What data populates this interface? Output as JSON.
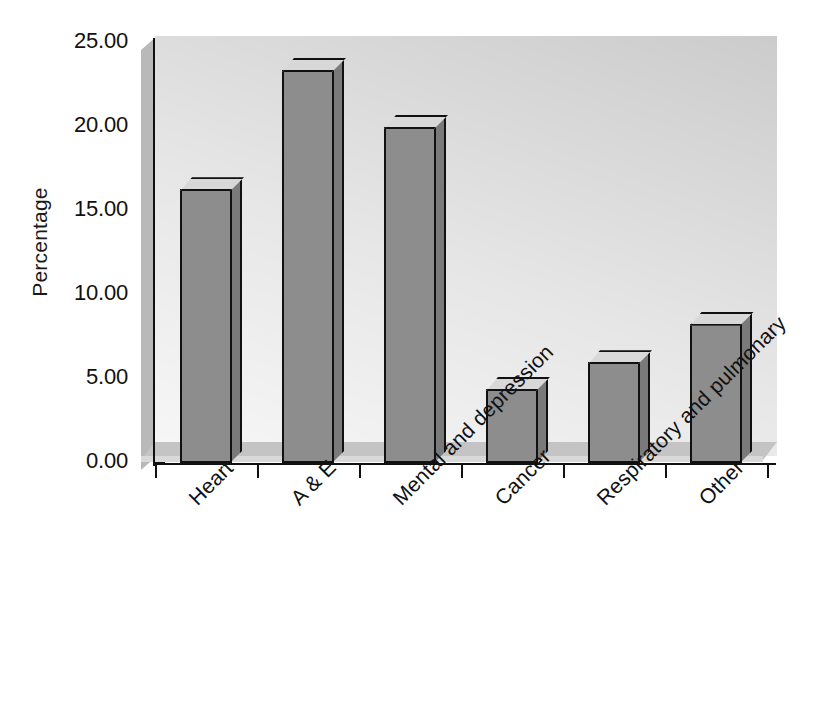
{
  "chart_data": {
    "type": "bar",
    "title": "",
    "subtitle": "",
    "xlabel": "",
    "ylabel": "Percentage",
    "categories": [
      "Heart",
      "A & E",
      "Mental and depression",
      "Cancer",
      "Respiratory and pulmonary",
      "Other"
    ],
    "values": [
      16.3,
      23.4,
      20.0,
      4.4,
      6.0,
      8.3
    ],
    "ylim": [
      0.0,
      25.0
    ],
    "ytick_values": [
      0.0,
      5.0,
      10.0,
      15.0,
      20.0,
      25.0
    ],
    "ytick_labels": [
      "0.00",
      "5.00",
      "10.00",
      "15.00",
      "20.00",
      "25.00"
    ],
    "grid": false,
    "legend": null,
    "legend_position": "none",
    "style": "3d-column",
    "series": [
      {
        "name": "Percentage",
        "values": [
          16.3,
          23.4,
          20.0,
          4.4,
          6.0,
          8.3
        ]
      }
    ],
    "annotations": []
  },
  "colors": {
    "bar_front": "#8d8d8d",
    "bar_side": "#7a7a7a",
    "bar_top": "#d8d8d8",
    "wall": "#c9c9c9",
    "floor": "#c4c4c4",
    "axis": "#111111",
    "background": "#ffffff",
    "text": "#111111"
  }
}
